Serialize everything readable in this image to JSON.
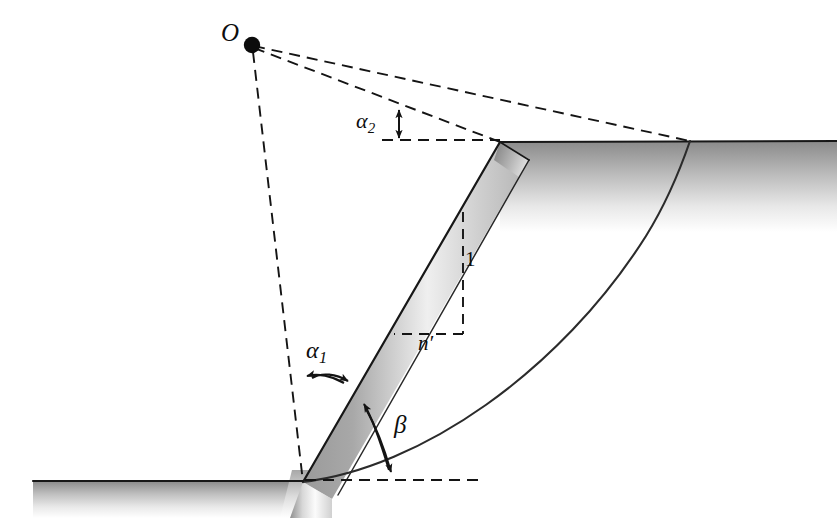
{
  "figure": {
    "kind": "slope-stability-diagram",
    "caption_text": "",
    "background_color": "#ffffff",
    "line_color": "#1a1a1a",
    "ground_fill_top": "#8c8c8c",
    "ground_fill_bottom": "#ffffff",
    "slope_band_dark": "#8e8e8e",
    "slope_band_light": "#f2f2f2"
  },
  "labels": {
    "center_point": "O",
    "alpha1_base": "α",
    "alpha1_sub": "1",
    "alpha2_base": "α",
    "alpha2_sub": "2",
    "beta": "β",
    "vertical_unit": "1",
    "horizontal_run": "n′"
  },
  "geometry": {
    "center_O": {
      "x": 252,
      "y": 45
    },
    "toe": {
      "x": 303,
      "y": 482
    },
    "crest": {
      "x": 500,
      "y": 142
    },
    "slip_exit": {
      "x": 690,
      "y": 141
    },
    "upper_ground_y": 141,
    "lower_ground_y": 481,
    "lower_ground_x_start": 33,
    "upper_ground_x_end": 837,
    "slope_band_width": 46,
    "unit_triangle": {
      "apex_top": {
        "x": 463,
        "y": 212
      },
      "corner": {
        "x": 463,
        "y": 333
      },
      "left": {
        "x": 396,
        "y": 333
      }
    },
    "alpha2_arrow_x": 399,
    "alpha2_arrow_top_y": 106,
    "alpha2_arrow_bottom_y": 140,
    "bottom_dashed_x_end": 478
  },
  "annotations": [
    {
      "name": "radius-to-crest",
      "style": "dashed",
      "from": "center_O",
      "to": "crest"
    },
    {
      "name": "radius-to-slip-exit",
      "style": "dashed",
      "from": "center_O",
      "to": "slip_exit"
    },
    {
      "name": "radius-to-toe",
      "style": "dashed",
      "from": "center_O",
      "to": "toe"
    },
    {
      "name": "slip-surface-arc",
      "style": "solid",
      "from": "toe",
      "to": "slip_exit"
    }
  ]
}
